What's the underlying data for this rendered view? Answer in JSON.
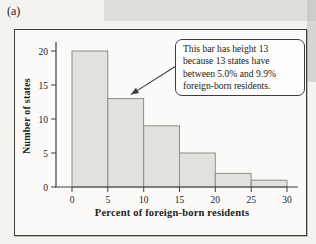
{
  "figure_label": "(a)",
  "chart_data": {
    "type": "bar",
    "subtype": "histogram",
    "title": "",
    "xlabel": "Percent of foreign-born residents",
    "ylabel": "Number of states",
    "bin_edges": [
      0,
      5,
      10,
      15,
      20,
      25,
      30
    ],
    "categories": [
      "0-5",
      "5-10",
      "10-15",
      "15-20",
      "20-25",
      "25-30"
    ],
    "values": [
      20,
      13,
      9,
      5,
      2,
      1
    ],
    "x_ticks": [
      0,
      5,
      10,
      15,
      20,
      25,
      30
    ],
    "y_ticks": [
      0,
      5,
      10,
      15,
      20
    ],
    "xlim": [
      0,
      30
    ],
    "ylim": [
      0,
      21.5
    ],
    "grid": false,
    "legend": null
  },
  "annotation": {
    "lines": [
      "This bar has height 13",
      "because 13 states have",
      "between 5.0% and 9.9%",
      "foreign-born residents."
    ],
    "text": "This bar has height 13 because 13 states have between 5.0% and 9.9% foreign-born residents.",
    "target_bar_index": 1
  },
  "colors": {
    "page_bg": "#f5f3ee",
    "panel_bg": "#fbfaf8",
    "panel_border": "#3c3c3c",
    "bar_fill": "#e2e1dd",
    "bar_stroke": "#8c8c8a",
    "axis": "#3f3f3f",
    "text": "#222222",
    "callout_bg": "#fdfdfc",
    "callout_border": "#3d3d3d",
    "scan_shadow": "#bdbdbb"
  }
}
